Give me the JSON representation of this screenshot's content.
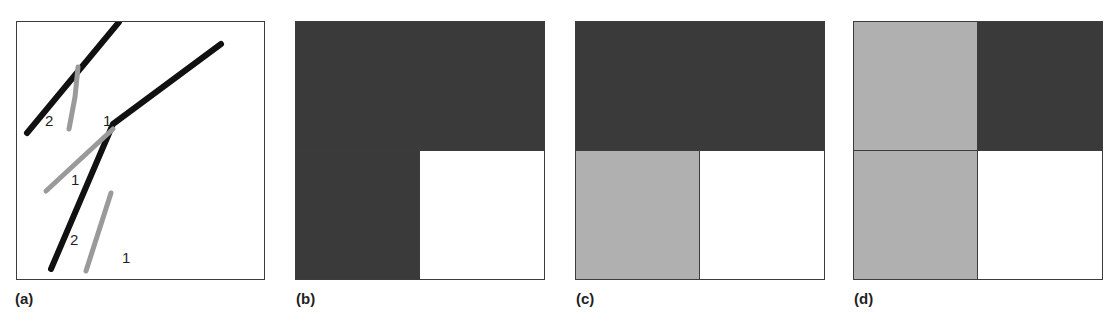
{
  "figure": {
    "width": 1114,
    "height": 322,
    "background": "#ffffff"
  },
  "colors": {
    "fault_black": "#111111",
    "marker_gray": "#9a9a9a",
    "dark_fill": "#3a3a3a",
    "light_fill": "#b0b0b0",
    "white_fill": "#ffffff",
    "border": "#3c3c3c",
    "text": "#1f1f1f"
  },
  "panels": [
    {
      "id": "a",
      "label": "(a)",
      "type": "line-sketch",
      "description": "Sketch of intersecting fault traces with numbered marker segments",
      "box": {
        "x": 16,
        "y": 21,
        "width": 249,
        "height": 259
      },
      "black_lines": [
        {
          "name": "upper-left-fault",
          "points": "10,111 102,0"
        },
        {
          "name": "branching-fault",
          "points": "34,247 96,102 204,22"
        }
      ],
      "gray_lines": [
        {
          "name": "gray-marker-upper",
          "points": "61,45 58,75 52,107"
        },
        {
          "name": "gray-marker-middle",
          "points": "29,169 96,107"
        },
        {
          "name": "gray-marker-lower",
          "points": "94,171 69,249"
        }
      ],
      "number_labels": [
        {
          "text": "2",
          "x": 28,
          "y": 91
        },
        {
          "text": "1",
          "x": 86,
          "y": 91
        },
        {
          "text": "1",
          "x": 54,
          "y": 150
        },
        {
          "text": "2",
          "x": 53,
          "y": 210
        },
        {
          "text": "1",
          "x": 105,
          "y": 228
        }
      ]
    },
    {
      "id": "b",
      "label": "(b)",
      "type": "quadrant-grid",
      "box": {
        "x": 295,
        "y": 21,
        "width": 250,
        "height": 259
      },
      "quadrants": [
        {
          "position": "top-left",
          "fill": "#3a3a3a",
          "tone": "dark"
        },
        {
          "position": "top-right",
          "fill": "#3a3a3a",
          "tone": "dark"
        },
        {
          "position": "bottom-left",
          "fill": "#3a3a3a",
          "tone": "dark"
        },
        {
          "position": "bottom-right",
          "fill": "#ffffff",
          "tone": "white"
        }
      ]
    },
    {
      "id": "c",
      "label": "(c)",
      "type": "quadrant-grid",
      "box": {
        "x": 575,
        "y": 21,
        "width": 250,
        "height": 259
      },
      "quadrants": [
        {
          "position": "top-left",
          "fill": "#3a3a3a",
          "tone": "dark"
        },
        {
          "position": "top-right",
          "fill": "#3a3a3a",
          "tone": "dark"
        },
        {
          "position": "bottom-left",
          "fill": "#b0b0b0",
          "tone": "light"
        },
        {
          "position": "bottom-right",
          "fill": "#ffffff",
          "tone": "white"
        }
      ]
    },
    {
      "id": "d",
      "label": "(d)",
      "type": "quadrant-grid",
      "box": {
        "x": 853,
        "y": 21,
        "width": 250,
        "height": 259
      },
      "quadrants": [
        {
          "position": "top-left",
          "fill": "#b0b0b0",
          "tone": "light"
        },
        {
          "position": "top-right",
          "fill": "#3a3a3a",
          "tone": "dark"
        },
        {
          "position": "bottom-left",
          "fill": "#b0b0b0",
          "tone": "light"
        },
        {
          "position": "bottom-right",
          "fill": "#ffffff",
          "tone": "white"
        }
      ]
    }
  ]
}
